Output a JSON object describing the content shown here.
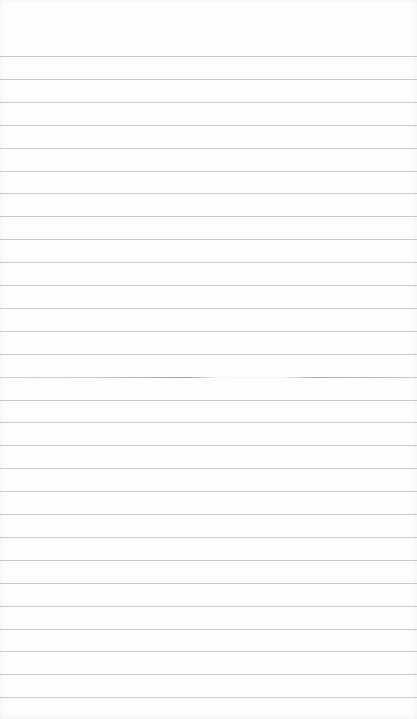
{
  "paper": {
    "type": "lined-paper",
    "background_color": "#fdfdfd",
    "line_color": "#c9c9c9",
    "first_line_y": 56,
    "line_spacing": 22.9,
    "line_count": 29,
    "faded_line_index": 14
  }
}
